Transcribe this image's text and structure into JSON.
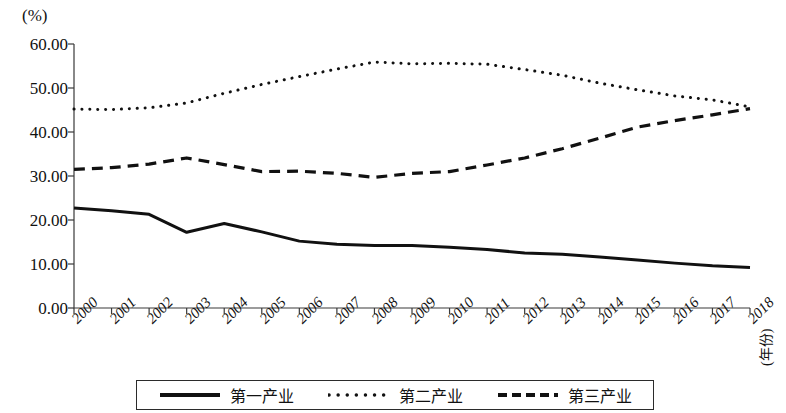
{
  "chart_data": {
    "type": "line",
    "title": "",
    "unit_label": "(%)",
    "xlabel": "(年份)",
    "ylabel": "",
    "x": [
      2000,
      2001,
      2002,
      2003,
      2004,
      2005,
      2006,
      2007,
      2008,
      2009,
      2010,
      2011,
      2012,
      2013,
      2014,
      2015,
      2016,
      2017,
      2018
    ],
    "categories": [
      "2000",
      "2001",
      "2002",
      "2003",
      "2004",
      "2005",
      "2006",
      "2007",
      "2008",
      "2009",
      "2010",
      "2011",
      "2012",
      "2013",
      "2014",
      "2015",
      "2016",
      "2017",
      "2018"
    ],
    "ylim": [
      0,
      60
    ],
    "ytick_values": [
      0,
      10,
      20,
      30,
      40,
      50,
      60
    ],
    "ytick_labels": [
      "0.00",
      "10.00",
      "20.00",
      "30.00",
      "40.00",
      "50.00",
      "60.00"
    ],
    "grid": false,
    "legend_position": "bottom",
    "series": [
      {
        "name": "第一产业",
        "style": "solid",
        "color": "#111111",
        "values": [
          22.7,
          22.1,
          21.3,
          17.2,
          19.2,
          17.3,
          15.2,
          14.5,
          14.2,
          14.2,
          13.8,
          13.3,
          12.5,
          12.2,
          11.6,
          10.9,
          10.2,
          9.6,
          9.2
        ]
      },
      {
        "name": "第二产业",
        "style": "dotted",
        "color": "#111111",
        "values": [
          45.2,
          45.1,
          45.5,
          46.6,
          48.8,
          50.8,
          52.6,
          54.3,
          55.9,
          55.5,
          55.6,
          55.4,
          54.2,
          52.9,
          51.1,
          49.6,
          48.2,
          47.3,
          45.7
        ]
      },
      {
        "name": "第三产业",
        "style": "dashed",
        "color": "#111111",
        "values": [
          31.5,
          31.9,
          32.7,
          34.1,
          32.6,
          31.0,
          31.1,
          30.6,
          29.7,
          30.6,
          31.0,
          32.5,
          34.1,
          36.2,
          38.6,
          41.1,
          42.6,
          43.9,
          45.3
        ]
      }
    ]
  },
  "legend": {
    "entries": [
      {
        "label": "第一产业",
        "style": "solid"
      },
      {
        "label": "第二产业",
        "style": "dotted"
      },
      {
        "label": "第三产业",
        "style": "dashed"
      }
    ]
  }
}
